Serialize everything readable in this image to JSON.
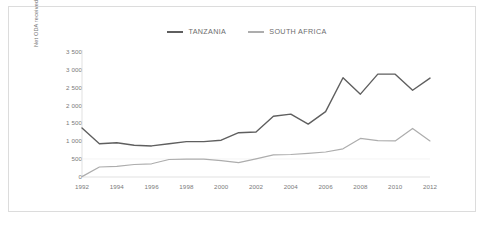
{
  "figure": {
    "border_color": "#dcdcdc",
    "background": "#ffffff"
  },
  "chart_data": {
    "type": "line",
    "title": "",
    "xlabel": "",
    "ylabel": "Net ODA received (current USD million)",
    "x": [
      1992,
      1993,
      1994,
      1995,
      1996,
      1997,
      1998,
      1999,
      2000,
      2001,
      2002,
      2003,
      2004,
      2005,
      2006,
      2007,
      2008,
      2009,
      2010,
      2011,
      2012
    ],
    "xlim": [
      1992,
      2012
    ],
    "ylim": [
      0,
      3500
    ],
    "yticks": [
      0,
      500,
      1000,
      1500,
      2000,
      2500,
      3000,
      3500
    ],
    "ytick_labels": [
      "0",
      "500",
      "1 000",
      "1 500",
      "2 000",
      "2 500",
      "3 000",
      "3 500"
    ],
    "xticks": [
      1992,
      1994,
      1996,
      1998,
      2000,
      2002,
      2004,
      2006,
      2008,
      2010,
      2012
    ],
    "xtick_labels": [
      "1992",
      "1994",
      "1996",
      "1998",
      "2000",
      "2002",
      "2004",
      "2006",
      "2008",
      "2010",
      "2012"
    ],
    "grid": false,
    "legend_position": "top-center",
    "series": [
      {
        "name": "TANZANIA",
        "color": "#5f5f5f",
        "values": [
          1370,
          930,
          960,
          890,
          870,
          930,
          990,
          990,
          1030,
          1240,
          1260,
          1700,
          1760,
          1480,
          1830,
          2780,
          2320,
          2880,
          2880,
          2430,
          2770
        ]
      },
      {
        "name": "SOUTH AFRICA",
        "color": "#adadad",
        "values": [
          10,
          280,
          300,
          350,
          370,
          490,
          500,
          500,
          460,
          400,
          510,
          620,
          630,
          660,
          700,
          790,
          1080,
          1020,
          1010,
          1360,
          1010
        ]
      }
    ]
  },
  "legend": {
    "items": [
      {
        "label": "TANZANIA",
        "color": "#5f5f5f"
      },
      {
        "label": "SOUTH AFRICA",
        "color": "#adadad"
      }
    ]
  },
  "axis": {
    "y_title": "Net ODA received (current USD million)"
  }
}
